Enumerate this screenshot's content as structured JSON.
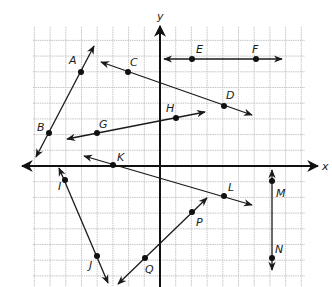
{
  "figure": {
    "type": "coordinate-plane",
    "axes": {
      "x_label": "x",
      "y_label": "y"
    },
    "grid": {
      "origin_px": [
        160,
        166
      ],
      "unit_px": 15.7,
      "x_range": [
        -8,
        9
      ],
      "y_range": [
        -8,
        9
      ]
    },
    "colors": {
      "line": "#1a1a1a",
      "grid": "#b8b8b8",
      "axis": "#111111",
      "background": "#ffffff"
    },
    "points": [
      {
        "label": "A",
        "px": [
          81,
          72
        ]
      },
      {
        "label": "B",
        "px": [
          49,
          133
        ]
      },
      {
        "label": "C",
        "px": [
          128,
          72
        ]
      },
      {
        "label": "D",
        "px": [
          224,
          106
        ]
      },
      {
        "label": "E",
        "px": [
          192,
          59
        ]
      },
      {
        "label": "F",
        "px": [
          256,
          59
        ]
      },
      {
        "label": "G",
        "px": [
          97,
          133
        ]
      },
      {
        "label": "H",
        "px": [
          176,
          118
        ]
      },
      {
        "label": "K",
        "px": [
          113,
          165
        ]
      },
      {
        "label": "L",
        "px": [
          224,
          196
        ]
      },
      {
        "label": "I",
        "px": [
          65,
          180
        ]
      },
      {
        "label": "J",
        "px": [
          97,
          256
        ]
      },
      {
        "label": "M",
        "px": [
          272,
          181
        ]
      },
      {
        "label": "N",
        "px": [
          272,
          258
        ]
      },
      {
        "label": "P",
        "px": [
          192,
          212
        ]
      },
      {
        "label": "Q",
        "px": [
          145,
          258
        ]
      }
    ],
    "lines": [
      {
        "name": "AB",
        "from": [
          36,
          157
        ],
        "to": [
          94,
          46
        ]
      },
      {
        "name": "CD",
        "from": [
          101,
          62
        ],
        "to": [
          252,
          115
        ]
      },
      {
        "name": "EF",
        "from": [
          164,
          59
        ],
        "to": [
          282,
          59
        ]
      },
      {
        "name": "GH",
        "from": [
          67,
          139
        ],
        "to": [
          205,
          112
        ]
      },
      {
        "name": "KL",
        "from": [
          84,
          156
        ],
        "to": [
          252,
          205
        ]
      },
      {
        "name": "IJ",
        "from": [
          59,
          168
        ],
        "to": [
          108,
          283
        ]
      },
      {
        "name": "MN",
        "from": [
          272,
          170
        ],
        "to": [
          272,
          270
        ]
      },
      {
        "name": "PQ",
        "from": [
          207,
          198
        ],
        "to": [
          118,
          284
        ]
      }
    ]
  }
}
